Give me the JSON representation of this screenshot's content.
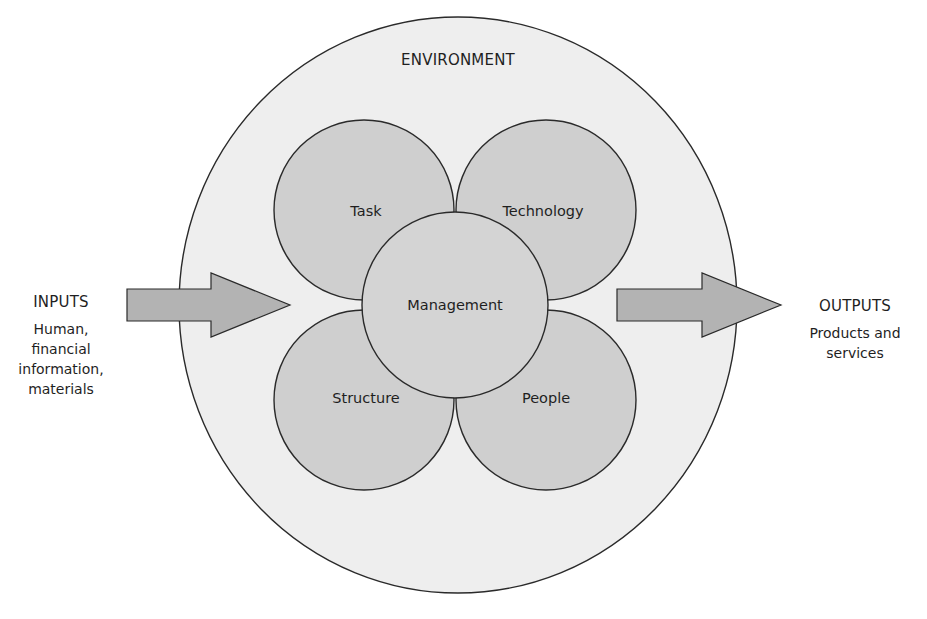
{
  "diagram": {
    "environment": {
      "label": "ENVIRONMENT"
    },
    "inputs": {
      "heading": "INPUTS",
      "lines": [
        "Human,",
        "financial",
        "information,",
        "materials"
      ]
    },
    "outputs": {
      "heading": "OUTPUTS",
      "lines": [
        "Products and",
        "services"
      ]
    },
    "nodes": {
      "task": "Task",
      "technology": "Technology",
      "management": "Management",
      "structure": "Structure",
      "people": "People"
    },
    "edges": [
      {
        "from": "inputs",
        "to": "environment",
        "type": "arrow"
      },
      {
        "from": "environment",
        "to": "outputs",
        "type": "arrow"
      }
    ],
    "colors": {
      "environment_fill": "#eeeeee",
      "petal_fill": "#cfcfcf",
      "management_fill": "#d4d4d4",
      "arrow_fill": "#b3b3b3",
      "stroke": "#2a2a2a"
    }
  }
}
